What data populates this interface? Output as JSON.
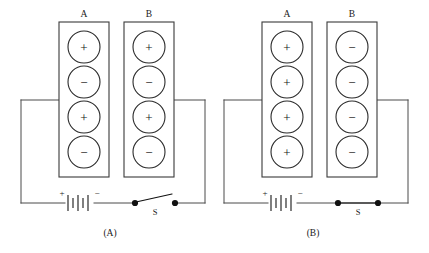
{
  "figure": {
    "background_color": "#ffffff",
    "line_color": "#4a4a4a",
    "glyph_color": "#111111",
    "plus_glyph": "+",
    "minus_glyph": "−",
    "panels": [
      {
        "caption": "(A)",
        "plates": [
          {
            "label": "A",
            "charges": [
              "+",
              "−",
              "+",
              "−"
            ]
          },
          {
            "label": "B",
            "charges": [
              "+",
              "−",
              "+",
              "−"
            ]
          }
        ],
        "battery": {
          "positive_label": "+",
          "negative_label": "−",
          "cell_count": 3
        },
        "switch": {
          "label": "S",
          "state": "open"
        }
      },
      {
        "caption": "(B)",
        "plates": [
          {
            "label": "A",
            "charges": [
              "+",
              "+",
              "+",
              "+"
            ]
          },
          {
            "label": "B",
            "charges": [
              "−",
              "−",
              "−",
              "−"
            ]
          }
        ],
        "battery": {
          "positive_label": "+",
          "negative_label": "−",
          "cell_count": 3
        },
        "switch": {
          "label": "S",
          "state": "closed"
        }
      }
    ]
  }
}
